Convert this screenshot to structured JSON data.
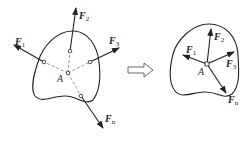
{
  "diagram": {
    "left_figure": {
      "point_label": "A",
      "forces": [
        {
          "name": "F",
          "sub": "1"
        },
        {
          "name": "F",
          "sub": "2"
        },
        {
          "name": "F",
          "sub": "3"
        },
        {
          "name": "F",
          "sub": "n"
        }
      ]
    },
    "transform_arrow": "hollow-right-arrow",
    "right_figure": {
      "point_label": "A",
      "forces": [
        {
          "name": "F",
          "sub": "1"
        },
        {
          "name": "F",
          "sub": "2"
        },
        {
          "name": "F",
          "sub": "3"
        },
        {
          "name": "F",
          "sub": "n"
        }
      ]
    },
    "colors": {
      "stroke": "#222222",
      "dash": "#555555"
    }
  }
}
